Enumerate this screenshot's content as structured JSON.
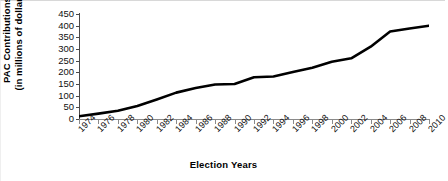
{
  "chart_data": {
    "type": "line",
    "title": "",
    "xlabel": "Election Years",
    "ylabel": "PAC Contributions (in millions of dollars)",
    "ylabel_line1": "PAC Contributions",
    "ylabel_line2": "(in millions of dollars)",
    "ylim": [
      0,
      450
    ],
    "yticks": [
      0,
      50,
      100,
      150,
      200,
      250,
      300,
      350,
      400,
      450
    ],
    "ytick_labels": [
      "0",
      "50",
      "100",
      "150",
      "200",
      "250",
      "300",
      "350",
      "400",
      "450"
    ],
    "grid": false,
    "legend": "none",
    "line_color": "#000000",
    "line_width": 2.6,
    "categories": [
      "1974",
      "1976",
      "1978",
      "1980",
      "1982",
      "1984",
      "1986",
      "1988",
      "1990",
      "1992",
      "1994",
      "1996",
      "1998",
      "2000",
      "2002",
      "2004",
      "2006",
      "2008",
      "2010"
    ],
    "values": [
      12,
      23,
      35,
      56,
      84,
      113,
      133,
      148,
      150,
      179,
      182,
      201,
      220,
      245,
      260,
      310,
      375,
      388,
      400
    ],
    "series": [
      {
        "name": "PAC Contributions",
        "values": [
          12,
          23,
          35,
          56,
          84,
          113,
          133,
          148,
          150,
          179,
          182,
          201,
          220,
          245,
          260,
          310,
          375,
          388,
          400
        ]
      }
    ]
  }
}
